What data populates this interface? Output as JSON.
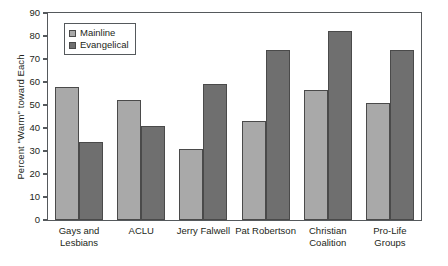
{
  "chart_data": {
    "type": "bar",
    "title": "",
    "xlabel": "",
    "ylabel": "Percent \"Warm\" toward Each",
    "ylim": [
      0,
      90
    ],
    "ytick_step": 10,
    "yticks": [
      90,
      80,
      70,
      60,
      50,
      40,
      30,
      20,
      10,
      0
    ],
    "grid": false,
    "legend_position": "upper-left-inside",
    "categories": [
      "Gays and\nLesbians",
      "ACLU",
      "Jerry Falwell",
      "Pat Robertson",
      "Christian\nCoalition",
      "Pro-Life\nGroups"
    ],
    "series": [
      {
        "name": "Mainline",
        "color": "#a9a9a9",
        "values": [
          58,
          52,
          31,
          43,
          56.5,
          51
        ]
      },
      {
        "name": "Evangelical",
        "color": "#6f6f6f",
        "values": [
          34,
          41,
          59,
          74,
          82,
          74
        ]
      }
    ]
  },
  "legend": {
    "items": [
      {
        "label": "Mainline",
        "swatch": "mainline"
      },
      {
        "label": "Evangelical",
        "swatch": "evangelical"
      }
    ]
  }
}
